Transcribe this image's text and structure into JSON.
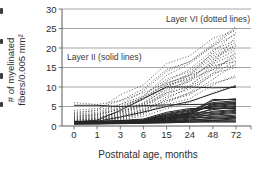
{
  "figure": {
    "y_axis_title_line1": "# of myelinated",
    "y_axis_title_line2": "fibers/0.005 mm²",
    "x_axis_title": "Postnatal age, months",
    "legend_layer_vi": "Layer VI (dotted lines)",
    "legend_layer_ii": "Layer II (solid lines)"
  },
  "chart_data": {
    "type": "line",
    "title": "",
    "xlabel": "Postnatal age, months",
    "ylabel": "# of myelinated fibers/0.005 mm²",
    "x_categories": [
      "0",
      "1",
      "3",
      "6",
      "15",
      "24",
      "48",
      "72"
    ],
    "y_ticks": [
      0,
      5,
      10,
      15,
      20,
      25,
      30
    ],
    "ylim": [
      0,
      30
    ],
    "grid": "horizontal",
    "legend_position": "inline-annotations",
    "colors": {
      "line_dotted": "#454545",
      "line_solid": "#262626",
      "grid": "#8f8f8f",
      "axis": "#5a5a5a",
      "text": "#2e2e2e",
      "background": "#ffffff"
    },
    "groups": [
      {
        "name": "Layer VI",
        "style": "dotted",
        "series": [
          [
            2.0,
            2.6,
            4.5,
            7.5,
            13.0,
            16.0,
            20.5,
            25.0
          ],
          [
            1.5,
            2.0,
            3.5,
            5.5,
            10.0,
            13.0,
            19.0,
            24.0
          ],
          [
            3.0,
            3.5,
            5.5,
            9.0,
            14.0,
            16.5,
            21.0,
            25.5
          ],
          [
            1.0,
            1.3,
            2.0,
            3.5,
            7.0,
            10.0,
            16.0,
            23.0
          ],
          [
            2.5,
            3.0,
            4.5,
            7.0,
            11.5,
            14.5,
            19.5,
            22.0
          ],
          [
            1.2,
            1.6,
            2.8,
            4.5,
            8.5,
            11.5,
            17.0,
            21.0
          ],
          [
            4.0,
            4.5,
            6.5,
            9.5,
            14.5,
            16.5,
            20.5,
            23.5
          ],
          [
            1.8,
            2.2,
            3.8,
            6.0,
            10.5,
            13.5,
            18.0,
            20.5
          ],
          [
            2.2,
            2.8,
            4.2,
            6.8,
            11.0,
            13.0,
            17.5,
            20.0
          ],
          [
            1.4,
            1.8,
            3.0,
            5.0,
            9.0,
            12.0,
            16.5,
            19.5
          ],
          [
            3.5,
            4.0,
            5.5,
            7.8,
            12.0,
            14.0,
            18.5,
            21.5
          ],
          [
            1.0,
            1.2,
            1.8,
            3.0,
            6.0,
            8.5,
            13.5,
            19.0
          ],
          [
            2.8,
            3.2,
            5.2,
            7.2,
            10.0,
            12.5,
            16.0,
            18.5
          ],
          [
            1.6,
            2.0,
            3.2,
            5.2,
            8.0,
            10.5,
            14.5,
            18.0
          ],
          [
            2.0,
            2.4,
            3.6,
            5.8,
            9.5,
            11.5,
            15.0,
            17.5
          ],
          [
            1.2,
            1.5,
            2.5,
            4.0,
            7.5,
            9.5,
            13.0,
            17.0
          ],
          [
            6.0,
            5.5,
            6.5,
            8.5,
            11.0,
            13.0,
            15.5,
            16.5
          ],
          [
            1.0,
            1.4,
            2.2,
            3.8,
            6.5,
            8.0,
            12.0,
            16.0
          ],
          [
            2.4,
            2.9,
            4.8,
            7.5,
            10.5,
            12.0,
            14.5,
            15.5
          ],
          [
            1.5,
            1.9,
            3.4,
            5.5,
            8.5,
            10.0,
            13.5,
            15.0
          ],
          [
            1.1,
            1.3,
            2.0,
            3.2,
            5.5,
            7.0,
            10.5,
            13.0
          ],
          [
            1.3,
            1.7,
            2.6,
            4.2,
            6.5,
            8.5,
            11.0,
            12.5
          ],
          [
            1.0,
            1.1,
            1.6,
            2.5,
            4.5,
            6.0,
            8.5,
            10.5
          ],
          [
            3.2,
            4.0,
            8.0,
            10.5,
            16.0,
            18.0,
            22.5,
            24.5
          ]
        ]
      },
      {
        "name": "Layer II",
        "style": "solid",
        "series": [
          [
            0.8,
            0.9,
            1.0,
            1.2,
            2.0,
            3.0,
            6.5,
            7.0
          ],
          [
            1.0,
            1.0,
            1.1,
            1.3,
            2.5,
            3.5,
            6.8,
            6.8
          ],
          [
            0.9,
            1.0,
            1.2,
            1.5,
            3.0,
            4.0,
            6.0,
            6.5
          ],
          [
            1.2,
            1.2,
            1.3,
            1.5,
            2.2,
            3.2,
            5.5,
            6.2
          ],
          [
            0.7,
            0.8,
            0.9,
            1.1,
            1.8,
            2.8,
            5.8,
            6.0
          ],
          [
            1.1,
            1.1,
            1.2,
            1.4,
            2.8,
            3.8,
            5.2,
            5.8
          ],
          [
            0.8,
            0.9,
            1.1,
            1.3,
            2.0,
            3.5,
            5.0,
            5.5
          ],
          [
            1.0,
            1.1,
            1.3,
            1.6,
            3.2,
            4.2,
            4.8,
            5.2
          ],
          [
            0.6,
            0.7,
            0.8,
            1.0,
            1.5,
            2.5,
            4.5,
            5.0
          ],
          [
            0.9,
            0.9,
            1.0,
            1.2,
            2.5,
            3.0,
            4.2,
            4.8
          ],
          [
            1.1,
            1.2,
            1.4,
            1.8,
            3.5,
            4.5,
            4.5,
            4.5
          ],
          [
            0.7,
            0.8,
            1.0,
            1.2,
            1.8,
            2.2,
            3.8,
            4.2
          ],
          [
            1.0,
            1.0,
            1.2,
            1.5,
            2.8,
            3.2,
            3.5,
            4.0
          ],
          [
            0.8,
            0.8,
            0.9,
            1.1,
            2.2,
            2.8,
            3.2,
            3.8
          ],
          [
            0.6,
            0.7,
            0.9,
            1.0,
            1.5,
            2.0,
            3.0,
            3.5
          ],
          [
            0.9,
            1.0,
            1.1,
            1.4,
            2.0,
            2.5,
            2.8,
            3.2
          ],
          [
            0.7,
            0.7,
            0.8,
            1.0,
            1.2,
            1.8,
            2.5,
            2.8
          ],
          [
            1.0,
            1.1,
            1.2,
            1.3,
            1.8,
            2.2,
            2.2,
            2.5
          ],
          [
            0.5,
            0.6,
            0.7,
            0.9,
            1.0,
            1.5,
            2.0,
            2.2
          ],
          [
            0.8,
            0.9,
            1.0,
            1.1,
            1.4,
            1.6,
            1.8,
            2.0
          ],
          [
            0.6,
            0.6,
            0.7,
            0.8,
            1.0,
            1.2,
            1.5,
            1.8
          ],
          [
            0.9,
            0.9,
            1.0,
            1.0,
            1.2,
            1.3,
            1.4,
            1.5
          ],
          [
            0.5,
            0.5,
            0.6,
            0.7,
            0.8,
            1.0,
            1.2,
            1.2
          ],
          [
            0.7,
            0.7,
            0.7,
            0.8,
            0.9,
            1.0,
            1.0,
            1.0
          ],
          [
            0.9,
            1.2,
            2.3,
            3.6,
            5.0,
            6.3,
            8.3,
            10.3
          ],
          [
            5.3,
            5.3,
            5.0,
            5.2,
            5.4,
            5.5,
            5.6,
            5.7
          ],
          [
            1.0,
            1.5,
            4.0,
            7.0,
            10.0,
            10.0,
            9.8,
            9.9
          ]
        ]
      }
    ]
  }
}
